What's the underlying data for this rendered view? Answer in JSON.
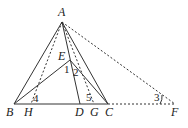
{
  "diagram": {
    "points": {
      "A": {
        "label": "A",
        "x": 62,
        "y": 22
      },
      "B": {
        "label": "B",
        "x": 14,
        "y": 104
      },
      "H": {
        "label": "H",
        "x": 31,
        "y": 104
      },
      "D": {
        "label": "D",
        "x": 80,
        "y": 104
      },
      "G": {
        "label": "G",
        "x": 94,
        "y": 104
      },
      "C": {
        "label": "C",
        "x": 108,
        "y": 104
      },
      "F": {
        "label": "F",
        "x": 175,
        "y": 104
      },
      "E": {
        "label": "E",
        "x": 70,
        "y": 60
      }
    },
    "angles": {
      "a1": "1",
      "a2": "2",
      "a3": "3",
      "a4": "4",
      "a5": "5"
    },
    "segments": [
      {
        "from": "A",
        "to": "B",
        "style": "solid"
      },
      {
        "from": "A",
        "to": "C",
        "style": "solid"
      },
      {
        "from": "A",
        "to": "D",
        "style": "solid"
      },
      {
        "from": "A",
        "to": "H",
        "style": "dashed"
      },
      {
        "from": "A",
        "to": "G",
        "style": "dashed"
      },
      {
        "from": "A",
        "to": "F",
        "style": "dashed"
      },
      {
        "from": "B",
        "to": "C",
        "style": "solid"
      },
      {
        "from": "C",
        "to": "F",
        "style": "dashed"
      },
      {
        "from": "B",
        "to": "E",
        "style": "solid"
      },
      {
        "from": "E",
        "to": "C",
        "style": "solid"
      }
    ],
    "color": "#333333"
  }
}
